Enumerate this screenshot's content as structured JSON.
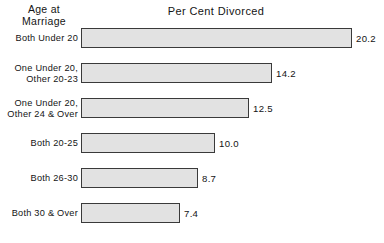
{
  "chart_data": {
    "type": "bar",
    "orientation": "horizontal",
    "title": "Per Cent Divorced",
    "category_axis_title": "Age at\nMarriage",
    "xlabel": "Per Cent Divorced",
    "ylabel": "Age at Marriage",
    "grid": false,
    "legend": null,
    "xlim": [
      0,
      20.2
    ],
    "categories": [
      "Both Under 20",
      "One Under 20,\nOther 20-23",
      "One Under 20,\nOther 24 & Over",
      "Both 20-25",
      "Both 26-30",
      "Both 30 & Over"
    ],
    "values": [
      20.2,
      14.2,
      12.5,
      10.0,
      8.7,
      7.4
    ],
    "value_labels": [
      "20.2",
      "14.2",
      "12.5",
      "10.0",
      "8.7",
      "7.4"
    ],
    "bars": [
      {
        "category": "Both Under 20",
        "value": 20.2,
        "label": "20.2"
      },
      {
        "category": "One Under 20,\nOther 20-23",
        "value": 14.2,
        "label": "14.2"
      },
      {
        "category": "One Under 20,\nOther 24 & Over",
        "value": 12.5,
        "label": "12.5"
      },
      {
        "category": "Both 20-25",
        "value": 10.0,
        "label": "10.0"
      },
      {
        "category": "Both 26-30",
        "value": 8.7,
        "label": "8.7"
      },
      {
        "category": "Both 30 & Over",
        "value": 7.4,
        "label": "7.4"
      }
    ],
    "colors": {
      "bar_fill": "#e2e2e2",
      "bar_border": "#3a3a3a",
      "text": "#141414",
      "background": "#ffffff"
    }
  }
}
